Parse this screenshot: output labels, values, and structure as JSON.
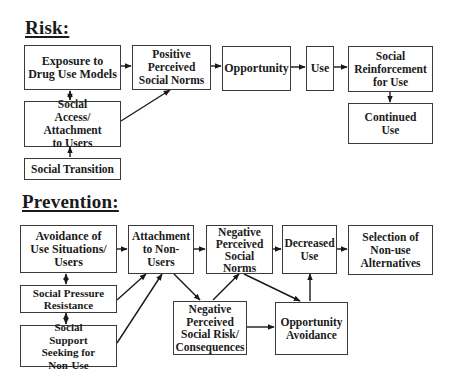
{
  "sections": {
    "risk": {
      "title": "Risk:",
      "nodes": {
        "exposure": "Exposure to Drug Use Models",
        "positive_norms": "Positive Perceived Social Norms",
        "opportunity": "Opportunity",
        "use": "Use",
        "social_reinforcement": "Social Reinforcement for Use",
        "continued_use": "Continued Use",
        "social_access": "Social Access/ Attachment to Users",
        "social_transition": "Social Transition"
      }
    },
    "prevention": {
      "title": "Prevention:",
      "nodes": {
        "avoidance": "Avoidance of Use Situations/ Users",
        "pressure_resistance": "Social Pressure Resistance",
        "support_seeking": "Social Support Seeking for Non-Use",
        "attachment_nonusers": "Attachment to Non-Users",
        "negative_norms": "Negative Perceived Social Norms",
        "decreased_use": "Decreased Use",
        "selection_alternatives": "Selection of Non-use Alternatives",
        "negative_risk": "Negative Perceived Social Risk/ Consequences",
        "opportunity_avoidance": "Opportunity Avoidance"
      }
    }
  },
  "edges": {
    "risk": [
      [
        "exposure",
        "positive_norms"
      ],
      [
        "positive_norms",
        "opportunity"
      ],
      [
        "opportunity",
        "use"
      ],
      [
        "use",
        "social_reinforcement"
      ],
      [
        "social_reinforcement",
        "continued_use"
      ],
      [
        "social_access",
        "positive_norms"
      ],
      [
        "social_access",
        "exposure",
        "bidirectional"
      ],
      [
        "social_transition",
        "social_access"
      ]
    ],
    "prevention": [
      [
        "avoidance",
        "attachment_nonusers"
      ],
      [
        "pressure_resistance",
        "attachment_nonusers"
      ],
      [
        "support_seeking",
        "attachment_nonusers"
      ],
      [
        "avoidance",
        "pressure_resistance",
        "bidirectional"
      ],
      [
        "pressure_resistance",
        "support_seeking",
        "bidirectional"
      ],
      [
        "attachment_nonusers",
        "negative_norms"
      ],
      [
        "attachment_nonusers",
        "negative_risk"
      ],
      [
        "negative_risk",
        "negative_norms"
      ],
      [
        "negative_norms",
        "decreased_use"
      ],
      [
        "negative_norms",
        "opportunity_avoidance"
      ],
      [
        "negative_risk",
        "opportunity_avoidance"
      ],
      [
        "opportunity_avoidance",
        "decreased_use"
      ],
      [
        "decreased_use",
        "selection_alternatives"
      ]
    ]
  },
  "colors": {
    "line": "#1a1a1a",
    "border": "#3a3a3a",
    "background": "#ffffff"
  }
}
